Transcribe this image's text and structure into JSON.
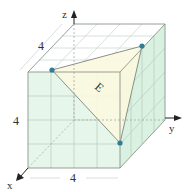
{
  "figure": {
    "axes": {
      "x_label": "x",
      "y_label": "y",
      "z_label": "z"
    },
    "dimensions": {
      "top_depth": "4",
      "front_height": "4",
      "front_width": "4"
    },
    "triangle_label": "E",
    "colors": {
      "front_face": "#e6f6ea",
      "side_face": "#d9f1e0",
      "triangle_fill": "#fbf8df",
      "grid": "#b9c9bc",
      "edge": "#8a948c",
      "point": "#2e7f93",
      "axis": "#222222"
    }
  }
}
